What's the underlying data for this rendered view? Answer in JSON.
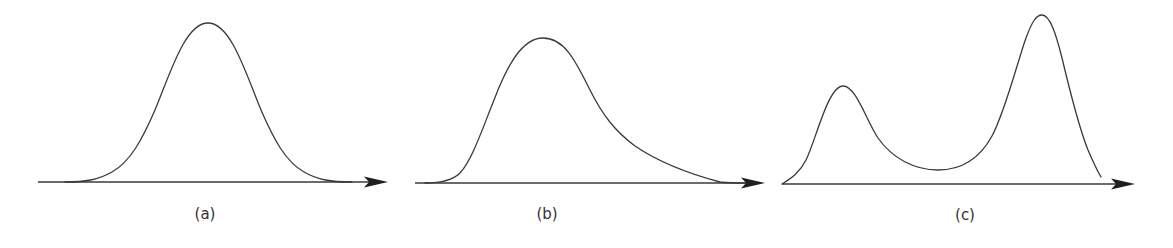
{
  "figure": {
    "panels": [
      {
        "id": "a",
        "label": "(a)",
        "description": "Symmetric unimodal distribution (bell curve)",
        "shape": "symmetric",
        "axis": {
          "x1": 38,
          "x2": 388,
          "y": 182
        },
        "peaks": [
          {
            "x": 208,
            "y": 23
          }
        ],
        "label_pos": {
          "x": 205,
          "y": 205
        }
      },
      {
        "id": "b",
        "label": "(b)",
        "description": "Right-skewed (positively skewed) unimodal distribution",
        "shape": "right-skewed",
        "axis": {
          "x1": 415,
          "x2": 765,
          "y": 183
        },
        "peaks": [
          {
            "x": 543,
            "y": 38
          }
        ],
        "label_pos": {
          "x": 547,
          "y": 205
        }
      },
      {
        "id": "c",
        "label": "(c)",
        "description": "Bimodal distribution with a smaller left peak and a taller right peak",
        "shape": "bimodal",
        "axis": {
          "x1": 782,
          "x2": 1135,
          "y": 184
        },
        "peaks": [
          {
            "x": 843,
            "y": 86
          },
          {
            "x": 1042,
            "y": 15
          }
        ],
        "trough": {
          "x": 938,
          "y": 170
        },
        "label_pos": {
          "x": 965,
          "y": 206
        }
      }
    ],
    "colors": {
      "curve": "#3a3a3a",
      "axis": "#3a3a3a",
      "arrowhead": "#1f1f1f",
      "label": "#333333",
      "background": "#ffffff"
    }
  }
}
